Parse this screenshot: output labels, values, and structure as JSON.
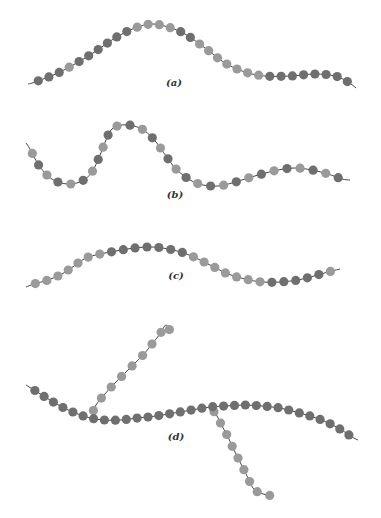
{
  "figure": {
    "colors": {
      "dark_bead": "#6f6f6f",
      "light_bead": "#9a9a9a",
      "backbone": "#444444",
      "background": "#ffffff"
    },
    "bead_radius": 4.6,
    "panels": [
      {
        "id": "a",
        "label": "(a)",
        "label_pos": [
          174,
          86
        ],
        "pattern": "DDDLDDDDDDLLLLDDLLLLLLLDDDDDDDDLLLD",
        "path": [
          [
            28,
            84
          ],
          [
            35,
            82
          ],
          [
            60,
            72
          ],
          [
            90,
            55
          ],
          [
            115,
            38
          ],
          [
            135,
            28
          ],
          [
            152,
            24
          ],
          [
            168,
            27
          ],
          [
            185,
            34
          ],
          [
            205,
            48
          ],
          [
            225,
            63
          ],
          [
            245,
            72
          ],
          [
            265,
            76
          ],
          [
            290,
            76
          ],
          [
            315,
            74
          ],
          [
            335,
            76
          ],
          [
            348,
            82
          ],
          [
            356,
            88
          ]
        ],
        "count": 31
      },
      {
        "id": "b",
        "label": "(b)",
        "label_pos": [
          175,
          198
        ],
        "pattern": "LDLDLDLDLDLDLDLDLDLDLDLDLDLDLDLDLDLD",
        "path": [
          [
            26,
            143
          ],
          [
            30,
            149
          ],
          [
            38,
            164
          ],
          [
            48,
            176
          ],
          [
            58,
            182
          ],
          [
            70,
            184
          ],
          [
            82,
            181
          ],
          [
            92,
            172
          ],
          [
            100,
            155
          ],
          [
            106,
            140
          ],
          [
            112,
            129
          ],
          [
            122,
            125
          ],
          [
            134,
            126
          ],
          [
            145,
            131
          ],
          [
            156,
            142
          ],
          [
            166,
            156
          ],
          [
            176,
            169
          ],
          [
            190,
            180
          ],
          [
            203,
            185
          ],
          [
            218,
            186
          ],
          [
            232,
            183
          ],
          [
            248,
            178
          ],
          [
            262,
            174
          ],
          [
            278,
            170
          ],
          [
            295,
            168
          ],
          [
            312,
            170
          ],
          [
            328,
            174
          ],
          [
            342,
            179
          ],
          [
            350,
            180
          ]
        ],
        "count": 30
      },
      {
        "id": "c",
        "label": "(c)",
        "label_pos": [
          176,
          279
        ],
        "pattern": "LLLLLLLDDDDDDDLLLLLLLDDDDDLLLLLDD",
        "path": [
          [
            26,
            287
          ],
          [
            34,
            284
          ],
          [
            48,
            280
          ],
          [
            62,
            274
          ],
          [
            74,
            266
          ],
          [
            86,
            258
          ],
          [
            100,
            254
          ],
          [
            116,
            251
          ],
          [
            134,
            248
          ],
          [
            152,
            247
          ],
          [
            168,
            249
          ],
          [
            184,
            253
          ],
          [
            198,
            259
          ],
          [
            212,
            266
          ],
          [
            228,
            274
          ],
          [
            245,
            279
          ],
          [
            262,
            282
          ],
          [
            280,
            282
          ],
          [
            298,
            280
          ],
          [
            314,
            276
          ],
          [
            328,
            272
          ],
          [
            340,
            269
          ]
        ],
        "count": 27
      },
      {
        "id": "d",
        "label": "(d)",
        "label_pos": [
          176,
          440
        ],
        "pattern": "DDDDDDDDDDDDDDDDDDDDDDDDDDDDDDDD",
        "path": [
          [
            26,
            385
          ],
          [
            34,
            390
          ],
          [
            50,
            400
          ],
          [
            64,
            408
          ],
          [
            78,
            414
          ],
          [
            90,
            418
          ],
          [
            104,
            420
          ],
          [
            120,
            420
          ],
          [
            138,
            418
          ],
          [
            156,
            416
          ],
          [
            174,
            413
          ],
          [
            192,
            410
          ],
          [
            210,
            407
          ],
          [
            226,
            406
          ],
          [
            244,
            405
          ],
          [
            262,
            406
          ],
          [
            280,
            408
          ],
          [
            296,
            412
          ],
          [
            310,
            416
          ],
          [
            324,
            421
          ],
          [
            340,
            429
          ],
          [
            352,
            437
          ],
          [
            358,
            440
          ]
        ],
        "count": 31,
        "branches": [
          {
            "pattern": "LLLLLLLLL",
            "path": [
              [
                92,
                414
              ],
              [
                96,
                405
              ],
              [
                104,
                395
              ],
              [
                114,
                384
              ],
              [
                124,
                374
              ],
              [
                134,
                364
              ],
              [
                144,
                354
              ],
              [
                152,
                344
              ],
              [
                160,
                334
              ],
              [
                166,
                325
              ],
              [
                171,
                333
              ]
            ],
            "count": 9
          },
          {
            "pattern": "LLLLLLLLL",
            "path": [
              [
                212,
                409
              ],
              [
                217,
                416
              ],
              [
                222,
                426
              ],
              [
                228,
                437
              ],
              [
                233,
                448
              ],
              [
                238,
                458
              ],
              [
                243,
                468
              ],
              [
                248,
                478
              ],
              [
                253,
                488
              ],
              [
                260,
                493
              ],
              [
                273,
                496
              ]
            ],
            "count": 9
          }
        ]
      }
    ]
  }
}
